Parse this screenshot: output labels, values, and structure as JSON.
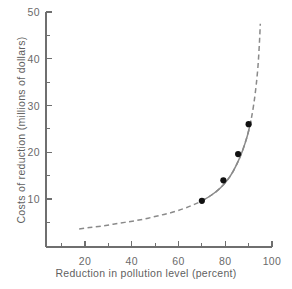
{
  "chart_data": {
    "type": "line",
    "title": "",
    "xlabel": "Reduction in pollution level (percent)",
    "ylabel": "Costs of reduction (millions of dollars)",
    "xlim": [
      0,
      104
    ],
    "ylim": [
      0,
      50
    ],
    "grid": false,
    "legend": null,
    "xticks_major": [
      20,
      40,
      60,
      80,
      100
    ],
    "xticks_minor": [
      10,
      30,
      50,
      70,
      90
    ],
    "yticks_major": [
      10,
      20,
      30,
      40,
      50
    ],
    "yticks_minor": [
      5,
      15,
      25,
      35,
      45
    ],
    "xtick_labels": [
      "20",
      "40",
      "60",
      "80",
      "100"
    ],
    "ytick_labels": [
      "10",
      "20",
      "30",
      "40",
      "50"
    ],
    "series": [
      {
        "name": "fitted cost curve",
        "style": "dashed",
        "color": "#8a8a8a",
        "x": [
          17.5,
          22,
          27,
          32,
          37,
          42,
          47,
          52,
          57,
          62,
          66,
          70,
          74,
          78,
          82,
          85,
          87.5,
          89.5,
          91,
          92.2,
          93.2,
          94,
          94.6,
          95
        ],
        "y": [
          3.6,
          3.9,
          4.2,
          4.6,
          5.0,
          5.4,
          5.9,
          6.5,
          7.1,
          7.9,
          8.7,
          9.6,
          10.8,
          12.4,
          14.8,
          17.5,
          20.5,
          23.6,
          26.8,
          30.3,
          34.2,
          38.4,
          43.2,
          47.5
        ]
      },
      {
        "name": "observed data points",
        "style": "markers",
        "color": "#111111",
        "x": [
          70.0,
          79.2,
          85.5,
          90.0
        ],
        "y": [
          9.6,
          14.0,
          19.6,
          26.0
        ]
      }
    ]
  },
  "figure": {
    "background": "#ffffff",
    "axis_color": "#6f6f6f",
    "curve_color": "#8a8a8a",
    "marker_color": "#111111",
    "text_color": "#5f5f5f"
  }
}
